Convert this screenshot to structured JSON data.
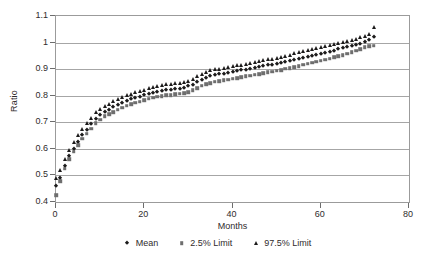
{
  "chart_data": {
    "type": "scatter",
    "title": "",
    "xlabel": "Months",
    "ylabel": "Ratio",
    "xlim": [
      0,
      80
    ],
    "ylim": [
      0.4,
      1.1
    ],
    "xticks": [
      0,
      20,
      40,
      60,
      80
    ],
    "ytick_labels": [
      "0.4",
      "0.5",
      "0.6",
      "0.7",
      "0.8",
      "0.9",
      "1",
      "1.1"
    ],
    "yticks": [
      0.4,
      0.5,
      0.6,
      0.7,
      0.8,
      0.9,
      1.0,
      1.1
    ],
    "grid": true,
    "legend_position": "bottom",
    "marker_colors": {
      "mean": "#1c1b1b",
      "low": "#6e6e6e",
      "high": "#1c1b1b"
    },
    "x": [
      0,
      1,
      2,
      3,
      4,
      5,
      6,
      7,
      8,
      9,
      10,
      11,
      12,
      13,
      14,
      15,
      16,
      17,
      18,
      19,
      20,
      21,
      22,
      23,
      24,
      25,
      26,
      27,
      28,
      29,
      30,
      31,
      32,
      33,
      34,
      35,
      36,
      37,
      38,
      39,
      40,
      41,
      42,
      43,
      44,
      45,
      46,
      47,
      48,
      49,
      50,
      51,
      52,
      53,
      54,
      55,
      56,
      57,
      58,
      59,
      60,
      61,
      62,
      63,
      64,
      65,
      66,
      67,
      68,
      69,
      70,
      71,
      72
    ],
    "series": [
      {
        "name": "Mean",
        "marker": "diamond",
        "values": [
          0.462,
          0.492,
          0.536,
          0.572,
          0.6,
          0.627,
          0.652,
          0.672,
          0.692,
          0.713,
          0.726,
          0.739,
          0.748,
          0.757,
          0.766,
          0.773,
          0.78,
          0.786,
          0.791,
          0.796,
          0.801,
          0.806,
          0.811,
          0.815,
          0.819,
          0.821,
          0.823,
          0.825,
          0.827,
          0.83,
          0.835,
          0.842,
          0.851,
          0.861,
          0.868,
          0.873,
          0.877,
          0.88,
          0.883,
          0.886,
          0.889,
          0.892,
          0.895,
          0.898,
          0.901,
          0.904,
          0.908,
          0.911,
          0.914,
          0.917,
          0.92,
          0.923,
          0.927,
          0.93,
          0.934,
          0.938,
          0.942,
          0.946,
          0.95,
          0.954,
          0.958,
          0.962,
          0.966,
          0.97,
          0.974,
          0.978,
          0.982,
          0.986,
          0.99,
          0.996,
          1.002,
          1.01,
          1.022
        ]
      },
      {
        "name": "2.5% Limit",
        "marker": "square",
        "values": [
          0.425,
          0.479,
          0.526,
          0.562,
          0.589,
          0.614,
          0.638,
          0.657,
          0.676,
          0.697,
          0.71,
          0.722,
          0.731,
          0.739,
          0.748,
          0.755,
          0.762,
          0.768,
          0.773,
          0.778,
          0.783,
          0.788,
          0.792,
          0.796,
          0.799,
          0.801,
          0.803,
          0.805,
          0.807,
          0.81,
          0.814,
          0.82,
          0.828,
          0.837,
          0.843,
          0.848,
          0.852,
          0.855,
          0.858,
          0.861,
          0.864,
          0.867,
          0.87,
          0.873,
          0.876,
          0.879,
          0.882,
          0.885,
          0.888,
          0.891,
          0.894,
          0.897,
          0.901,
          0.904,
          0.908,
          0.912,
          0.916,
          0.92,
          0.924,
          0.928,
          0.932,
          0.936,
          0.94,
          0.944,
          0.948,
          0.952,
          0.958,
          0.964,
          0.97,
          0.976,
          0.982,
          0.986,
          0.988
        ]
      },
      {
        "name": "97.5% Limit",
        "marker": "triangle",
        "values": [
          0.492,
          0.522,
          0.561,
          0.597,
          0.625,
          0.652,
          0.676,
          0.696,
          0.716,
          0.737,
          0.749,
          0.761,
          0.77,
          0.779,
          0.788,
          0.795,
          0.802,
          0.808,
          0.813,
          0.818,
          0.823,
          0.828,
          0.833,
          0.837,
          0.841,
          0.843,
          0.845,
          0.847,
          0.849,
          0.852,
          0.857,
          0.864,
          0.873,
          0.883,
          0.89,
          0.895,
          0.899,
          0.902,
          0.905,
          0.908,
          0.911,
          0.914,
          0.917,
          0.92,
          0.923,
          0.927,
          0.931,
          0.934,
          0.937,
          0.94,
          0.943,
          0.947,
          0.951,
          0.955,
          0.959,
          0.963,
          0.967,
          0.971,
          0.975,
          0.979,
          0.983,
          0.987,
          0.991,
          0.995,
          0.999,
          1.003,
          1.007,
          1.011,
          1.015,
          1.02,
          1.026,
          1.034,
          1.06
        ]
      }
    ]
  },
  "legend": {
    "items": [
      {
        "label": "Mean",
        "marker": "diamond"
      },
      {
        "label": "2.5% Limit",
        "marker": "square"
      },
      {
        "label": "97.5% Limit",
        "marker": "triangle"
      }
    ]
  }
}
